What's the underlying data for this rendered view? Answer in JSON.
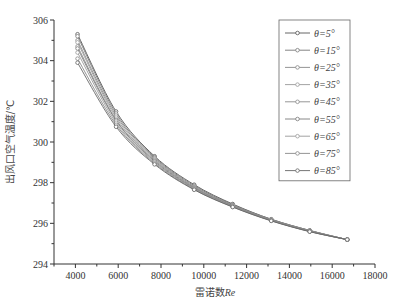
{
  "chart_data": {
    "type": "line",
    "title": "",
    "xlabel": "雷诺数Re",
    "ylabel": "出风口空气温度/℃",
    "xlim": [
      3000,
      18000
    ],
    "ylim": [
      294,
      306
    ],
    "x_ticks": [
      4000,
      6000,
      8000,
      10000,
      12000,
      14000,
      16000,
      18000
    ],
    "y_ticks": [
      294,
      296,
      298,
      300,
      302,
      304,
      306
    ],
    "grid": false,
    "legend_position": "upper right (inside)",
    "x": [
      4100,
      5900,
      7700,
      9550,
      11350,
      13150,
      14950,
      16700
    ],
    "series": [
      {
        "name": "θ=5°",
        "values": [
          305.3,
          301.5,
          299.3,
          297.9,
          296.95,
          296.2,
          295.65,
          295.2
        ]
      },
      {
        "name": "θ=15°",
        "values": [
          305.2,
          301.4,
          299.25,
          297.85,
          296.92,
          296.2,
          295.65,
          295.2
        ]
      },
      {
        "name": "θ=25°",
        "values": [
          305.0,
          301.3,
          299.2,
          297.8,
          296.9,
          296.18,
          295.64,
          295.2
        ]
      },
      {
        "name": "θ=35°",
        "values": [
          304.9,
          301.2,
          299.15,
          297.78,
          296.88,
          296.17,
          295.63,
          295.2
        ]
      },
      {
        "name": "θ=45°",
        "values": [
          304.7,
          301.1,
          299.1,
          297.75,
          296.86,
          296.16,
          295.62,
          295.2
        ]
      },
      {
        "name": "θ=55°",
        "values": [
          304.6,
          301.05,
          299.05,
          297.72,
          296.85,
          296.15,
          295.61,
          295.2
        ]
      },
      {
        "name": "θ=65°",
        "values": [
          304.4,
          300.95,
          299.0,
          297.7,
          296.83,
          296.14,
          295.6,
          295.2
        ]
      },
      {
        "name": "θ=75°",
        "values": [
          304.1,
          300.85,
          298.95,
          297.67,
          296.81,
          296.13,
          295.6,
          295.2
        ]
      },
      {
        "name": "θ=85°",
        "values": [
          303.9,
          300.75,
          298.9,
          297.65,
          296.8,
          296.12,
          295.59,
          295.2
        ]
      }
    ]
  },
  "axes": {
    "xlabel_prefix": "雷诺数",
    "xlabel_var": "Re",
    "ylabel": "出风口空气温度/℃"
  },
  "colors": {
    "axis": "#333333",
    "series": [
      "#555555",
      "#777777",
      "#888888",
      "#999999",
      "#8a8a8a",
      "#7a7a7a",
      "#999999",
      "#888888",
      "#666666"
    ],
    "legend_border": "#666666"
  }
}
